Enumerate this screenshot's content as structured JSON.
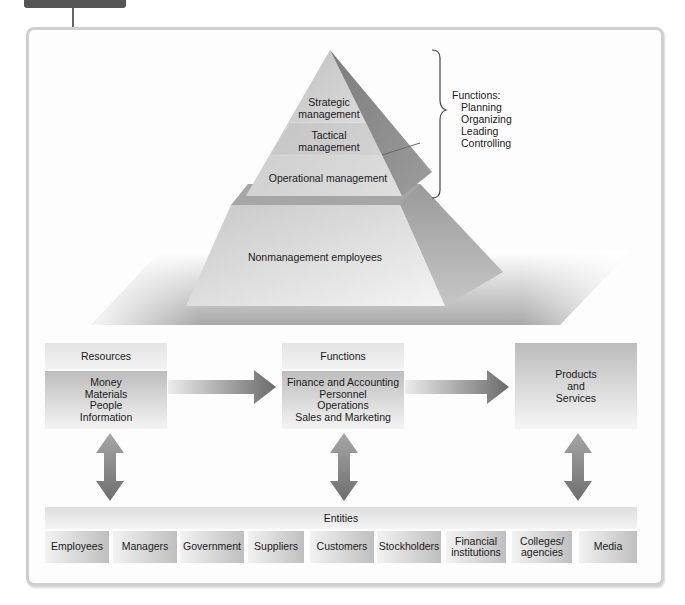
{
  "figure": {
    "tab_color": "#555555"
  },
  "pyramid": {
    "levels": [
      {
        "id": "strategic",
        "label": "Strategic management"
      },
      {
        "id": "tactical",
        "label": "Tactical management"
      },
      {
        "id": "operational",
        "label": "Operational management"
      },
      {
        "id": "nonmanagement",
        "label": "Nonmanagement employees"
      }
    ],
    "strategic_line1": "Strategic",
    "strategic_line2": "management",
    "tactical_line1": "Tactical",
    "tactical_line2": "management",
    "operational": "Operational management",
    "nonmanagement": "Nonmanagement employees"
  },
  "management_functions": {
    "title": "Functions:",
    "items": [
      "Planning",
      "Organizing",
      "Leading",
      "Controlling"
    ]
  },
  "flow": {
    "resources": {
      "title": "Resources",
      "items": [
        "Money",
        "Materials",
        "People",
        "Information"
      ]
    },
    "functions": {
      "title": "Functions",
      "items": [
        "Finance and Accounting",
        "Personnel",
        "Operations",
        "Sales and Marketing"
      ]
    },
    "outputs": {
      "line1": "Products",
      "line2": "and",
      "line3": "Services"
    }
  },
  "entities": {
    "title": "Entities",
    "items": [
      {
        "label": "Employees"
      },
      {
        "label": "Managers"
      },
      {
        "label": "Government"
      },
      {
        "label": "Suppliers"
      },
      {
        "label": "Customers"
      },
      {
        "label": "Stockholders"
      },
      {
        "label": "Financial institutions",
        "line1": "Financial",
        "line2": "institutions"
      },
      {
        "label": "Colleges/ agencies",
        "line1": "Colleges/",
        "line2": "agencies"
      },
      {
        "label": "Media"
      }
    ]
  },
  "colors": {
    "arrow_dark": "#6e6e6e",
    "arrow_light": "#e6e6e6",
    "frame_border": "#cfcfcf"
  }
}
